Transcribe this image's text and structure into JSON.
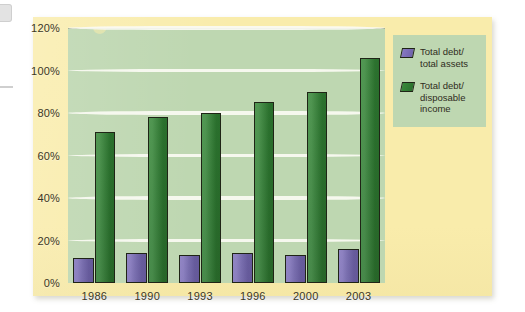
{
  "chart_data": {
    "type": "bar",
    "title": "",
    "xlabel": "",
    "ylabel": "",
    "categories": [
      "1986",
      "1990",
      "1993",
      "1996",
      "2000",
      "2003"
    ],
    "series": [
      {
        "name": "Total debt/\ntotal assets",
        "key": "total-debt-total-assets",
        "color": "#6f62aa",
        "values": [
          12,
          14,
          13,
          14,
          13,
          16
        ]
      },
      {
        "name": "Total debt/\ndisposable income",
        "key": "total-debt-disposable-income",
        "color": "#2f7c32",
        "values": [
          71,
          78,
          80,
          85,
          90,
          106
        ]
      }
    ],
    "ylim": [
      0,
      120
    ],
    "ytick_step": 20,
    "ytick_labels": [
      "0%",
      "20%",
      "40%",
      "60%",
      "80%",
      "100%",
      "120%"
    ],
    "ytick_values": [
      0,
      20,
      40,
      60,
      80,
      100,
      120
    ],
    "grid": true,
    "grid_color": "#fbfbf4",
    "legend_position": "top-right",
    "plot_background": "#bed7b1",
    "page_background": "#f9ecab"
  },
  "legend": {
    "items": [
      {
        "label": "Total debt/\ntotal assets",
        "swatch": "purple"
      },
      {
        "label": "Total debt/\ndisposable income",
        "swatch": "green"
      }
    ]
  }
}
